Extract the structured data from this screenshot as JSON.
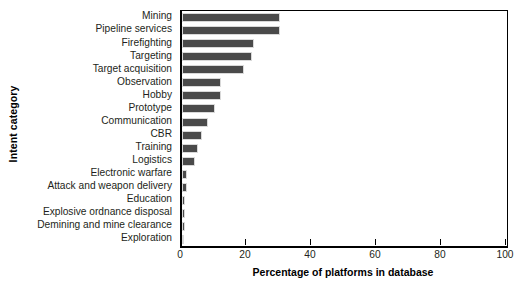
{
  "chart_data": {
    "type": "bar",
    "orientation": "horizontal",
    "title": "",
    "xlabel": "Percentage of platforms in database",
    "ylabel": "Intent category",
    "xlim": [
      0,
      100
    ],
    "xticks": [
      0,
      20,
      40,
      60,
      80,
      100
    ],
    "xtick_labels": [
      "0",
      "20",
      "40",
      "60",
      "80",
      "100"
    ],
    "grid": false,
    "legend": false,
    "bar_color": "#4a4a4a",
    "axis_color": "#000000",
    "categories": [
      "Mining",
      "Pipeline services",
      "Firefighting",
      "Targeting",
      "Target acquisition",
      "Observation",
      "Hobby",
      "Prototype",
      "Communication",
      "CBR",
      "Training",
      "Logistics",
      "Electronic warfare",
      "Attack and weapon delivery",
      "Education",
      "Explosive ordnance disposal",
      "Demining and mine clearance",
      "Exploration"
    ],
    "values": [
      30,
      30,
      22,
      21.5,
      19,
      12,
      12,
      10,
      8,
      6,
      5,
      4,
      1.5,
      1.5,
      1,
      1,
      0.8,
      0.5
    ]
  }
}
